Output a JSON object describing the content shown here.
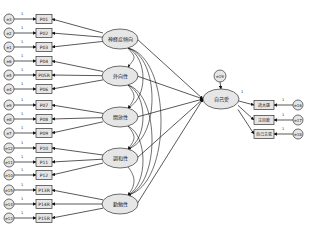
{
  "diagram": {
    "type": "structural-equation-model",
    "central_latent": {
      "label": "自己愛",
      "x": 221,
      "y": 99
    },
    "central_error": {
      "label": "e19",
      "x": 220,
      "y": 76
    },
    "latents": [
      {
        "label": "神経症傾向",
        "x": 120,
        "y": 39,
        "indicators": [
          {
            "label": "P01",
            "y": 19,
            "error": "e3"
          },
          {
            "label": "P02",
            "y": 33,
            "error": "e2"
          },
          {
            "label": "P03",
            "y": 47,
            "error": "e1"
          }
        ]
      },
      {
        "label": "外向性",
        "x": 120,
        "y": 76,
        "indicators": [
          {
            "label": "P04",
            "y": 61,
            "error": "e6"
          },
          {
            "label": "P05R",
            "y": 75,
            "error": "e5"
          },
          {
            "label": "P06",
            "y": 89,
            "error": "e4"
          }
        ]
      },
      {
        "label": "開放性",
        "x": 120,
        "y": 117,
        "indicators": [
          {
            "label": "P07",
            "y": 105,
            "error": "e9"
          },
          {
            "label": "P08",
            "y": 119,
            "error": "e8"
          },
          {
            "label": "P09",
            "y": 133,
            "error": "e7"
          }
        ]
      },
      {
        "label": "調和性",
        "x": 120,
        "y": 158,
        "indicators": [
          {
            "label": "P10",
            "y": 148,
            "error": "e12"
          },
          {
            "label": "P11",
            "y": 162,
            "error": "e11"
          },
          {
            "label": "P12",
            "y": 175,
            "error": "e10"
          }
        ]
      },
      {
        "label": "勤勉性",
        "x": 120,
        "y": 204,
        "indicators": [
          {
            "label": "P13R",
            "y": 190,
            "error": "e15"
          },
          {
            "label": "P14R",
            "y": 204,
            "error": "e14"
          },
          {
            "label": "P15R",
            "y": 218,
            "error": "e13"
          }
        ]
      }
    ],
    "outcome_indicators": [
      {
        "label": "誇大感",
        "y": 105,
        "error": "e16"
      },
      {
        "label": "注目欲",
        "y": 120,
        "error": "e17"
      },
      {
        "label": "自己主張",
        "y": 134,
        "error": "e18"
      }
    ],
    "path_label": "1"
  }
}
